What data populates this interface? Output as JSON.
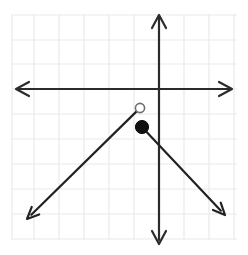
{
  "figure": {
    "width": 248,
    "height": 255,
    "background_color": "#ffffff"
  },
  "grid": {
    "visible": true,
    "spacing_px": 25,
    "color": "#e9e9ee",
    "line_width": 1.2,
    "x_start_px": 12,
    "x_end_px": 237,
    "y_start_px": 14,
    "y_end_px": 240,
    "vertical_lines_px": [
      12,
      34,
      59,
      84,
      109,
      134,
      159,
      184,
      209,
      234
    ],
    "horizontal_lines_px": [
      15,
      40,
      64,
      89,
      114,
      139,
      164,
      189,
      214,
      239
    ]
  },
  "axes": {
    "color": "#2b2b2b",
    "line_width": 2.2,
    "origin_px": {
      "x": 159,
      "y": 89
    },
    "x_axis": {
      "label": "x-axis",
      "y_px": 89,
      "from_px": 14,
      "to_px": 234,
      "arrow_left": true,
      "arrow_right": true
    },
    "y_axis": {
      "label": "y-axis",
      "x_px": 159,
      "from_px": 13,
      "to_px": 243,
      "arrow_up": true,
      "arrow_down": true
    }
  },
  "chart_data": {
    "type": "line",
    "title": "",
    "xlabel": "",
    "ylabel": "",
    "grid": true,
    "legend": "none",
    "xlim": [
      -5.88,
      3.0
    ],
    "ylim": [
      -6.04,
      3.04
    ],
    "unit_px": 25,
    "series": [
      {
        "name": "left-branch",
        "style": "solid",
        "color": "#222222",
        "line_width": 2.2,
        "endpoint_marker": "open-circle",
        "arrow_end": "down-left",
        "from_point": {
          "x": -0.76,
          "y": -0.76,
          "px": {
            "x": 140,
            "y": 108
          }
        },
        "to_point": {
          "x": -5.28,
          "y": -5.2,
          "px": {
            "x": 27,
            "y": 219
          }
        }
      },
      {
        "name": "right-branch",
        "style": "solid",
        "color": "#222222",
        "line_width": 2.2,
        "endpoint_marker": "filled-circle",
        "arrow_end": "down-right",
        "from_point": {
          "x": -0.68,
          "y": -1.52,
          "px": {
            "x": 142,
            "y": 127
          }
        },
        "to_point": {
          "x": 2.64,
          "y": -5.04,
          "px": {
            "x": 225,
            "y": 215
          }
        }
      }
    ],
    "markers": [
      {
        "name": "open-endpoint",
        "kind": "open-circle",
        "x": -0.76,
        "y": -0.76,
        "px": {
          "x": 140,
          "y": 108
        },
        "radius_px": 4.6,
        "fill": "#ffffff",
        "stroke": "#6f6f72",
        "stroke_width": 1.6
      },
      {
        "name": "closed-endpoint",
        "kind": "filled-circle",
        "x": -0.68,
        "y": -1.52,
        "px": {
          "x": 142,
          "y": 127
        },
        "radius_px": 6.6,
        "fill": "#111111",
        "stroke": "#111111",
        "stroke_width": 1
      }
    ],
    "annotations": []
  }
}
